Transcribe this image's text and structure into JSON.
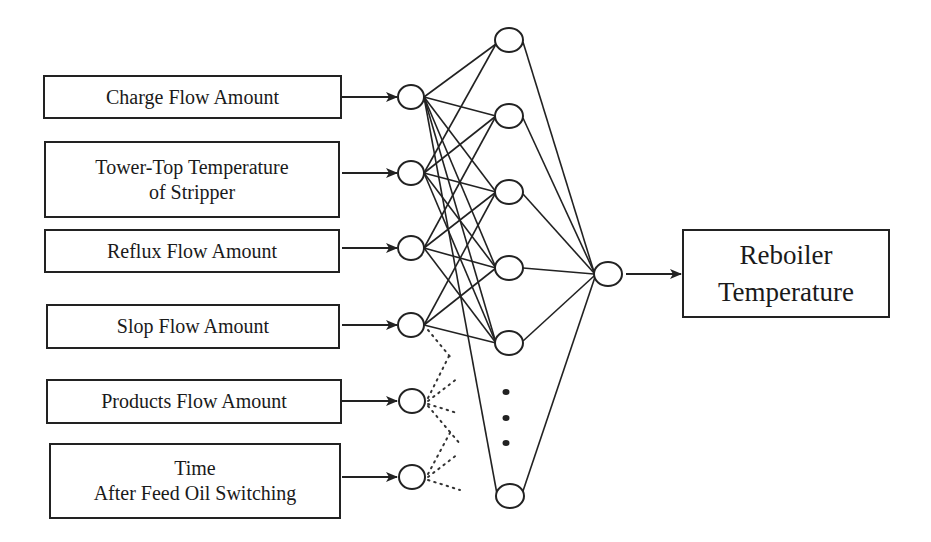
{
  "diagram": {
    "type": "neural-network",
    "inputs": [
      {
        "lines": [
          "Charge Flow Amount"
        ]
      },
      {
        "lines": [
          "Tower-Top Temperature",
          "of Stripper"
        ]
      },
      {
        "lines": [
          "Reflux Flow Amount"
        ]
      },
      {
        "lines": [
          "Slop Flow Amount"
        ]
      },
      {
        "lines": [
          "Products Flow Amount"
        ]
      },
      {
        "lines": [
          "Time",
          "After Feed Oil Switching"
        ]
      }
    ],
    "output": {
      "lines": [
        "Reboiler",
        "Temperature"
      ]
    },
    "layers": {
      "input_nodes": 6,
      "hidden_nodes_shown": 6,
      "hidden_ellipsis": "⋮",
      "output_nodes": 1
    },
    "connection_styles": {
      "inputs_1_to_4": "solid",
      "inputs_5_to_6": "dotted"
    },
    "colors": {
      "stroke": "#222222",
      "background": "#ffffff"
    }
  }
}
